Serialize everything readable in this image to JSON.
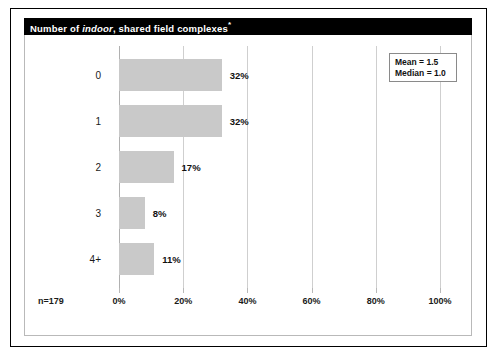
{
  "title": {
    "prefix": "Number of ",
    "italic": "indoor",
    "suffix": ", shared field complexes",
    "footnote_marker": "*",
    "full": "Number of indoor, shared field complexes*"
  },
  "sample_size_label": "n=179",
  "stats": {
    "mean_label": "Mean = 1.5",
    "median_label": "Median = 1.0",
    "mean": 1.5,
    "median": 1.0
  },
  "colors": {
    "bar_fill": "#c9c9c9",
    "title_bar": "#000000",
    "title_text": "#ffffff",
    "gridline": "#cfcfcf",
    "frame": "#000000"
  },
  "chart_data": {
    "type": "bar",
    "orientation": "horizontal",
    "title": "Number of indoor, shared field complexes*",
    "categories": [
      "0",
      "1",
      "2",
      "3",
      "4+"
    ],
    "values": [
      32,
      32,
      17,
      8,
      11
    ],
    "value_labels": [
      "32%",
      "32%",
      "17%",
      "8%",
      "11%"
    ],
    "xlabel": "",
    "ylabel": "",
    "xlim": [
      0,
      100
    ],
    "ylim": null,
    "xticks": [
      0,
      20,
      40,
      60,
      80,
      100
    ],
    "xtick_labels": [
      "0%",
      "20%",
      "40%",
      "60%",
      "80%",
      "100%"
    ],
    "grid": true,
    "grid_axis": "x",
    "legend": false,
    "legend_position": "none",
    "annotations": [
      "Mean = 1.5",
      "Median = 1.0",
      "n=179"
    ],
    "units": "percent"
  }
}
